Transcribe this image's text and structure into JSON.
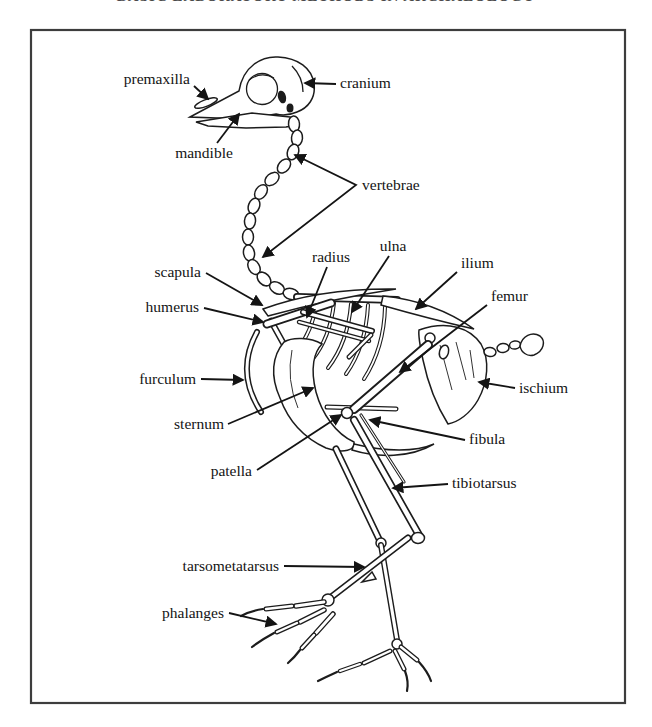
{
  "header": {
    "text": "BASIC LABORATORY METHODS IN ARCHAEOLOGY"
  },
  "figure": {
    "type": "labeled-anatomical-line-drawing",
    "colors": {
      "ink": "#1c1c1c",
      "frame": "#3d3d3d",
      "paper": "#ffffff"
    },
    "labels": [
      {
        "text": "premaxilla"
      },
      {
        "text": "cranium"
      },
      {
        "text": "mandible"
      },
      {
        "text": "vertebrae"
      },
      {
        "text": "scapula"
      },
      {
        "text": "radius"
      },
      {
        "text": "ulna"
      },
      {
        "text": "ilium"
      },
      {
        "text": "femur"
      },
      {
        "text": "humerus"
      },
      {
        "text": "furculum"
      },
      {
        "text": "ischium"
      },
      {
        "text": "sternum"
      },
      {
        "text": "fibula"
      },
      {
        "text": "patella"
      },
      {
        "text": "tibiotarsus"
      },
      {
        "text": "tarsometatarsus"
      },
      {
        "text": "phalanges"
      }
    ]
  }
}
